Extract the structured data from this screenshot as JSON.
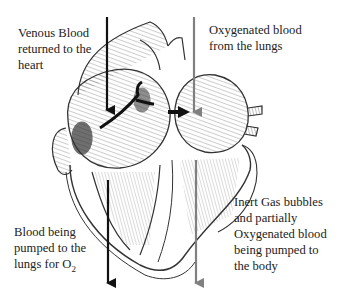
{
  "diagram": {
    "labels": {
      "venous": "Venous Blood\nreturned to the\nheart",
      "oxygenated": "Oxygenated blood\nfrom the lungs",
      "to_lungs_prefix": "Blood being\npumped to the\nlungs for O",
      "to_lungs_sub": "2",
      "to_body": "Inert Gas bubbles\nand partially\nOxygenated blood\nbeing pumped to\nthe body"
    },
    "colors": {
      "deoxygenated_arrow": "#111111",
      "oxygenated_arrow": "#808080",
      "line_art": "#333333"
    }
  }
}
